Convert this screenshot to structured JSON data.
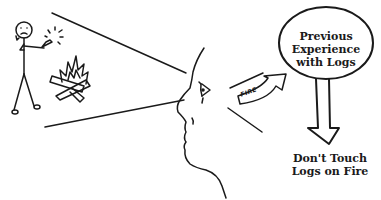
{
  "diagram": {
    "scene": {
      "observer": "stick-figure-holding-lighter",
      "stimulus": "burning-logs"
    },
    "perception": {
      "viewer": "face-profile",
      "arrow_label": "FIRE"
    },
    "memory_bubble": {
      "line1": "Previous",
      "line2": "Experience",
      "line3": "with Logs"
    },
    "outcome": {
      "line1": "Don't Touch",
      "line2": "Logs on Fire"
    },
    "colors": {
      "ink": "#1a1a1a",
      "background": "#ffffff"
    }
  }
}
